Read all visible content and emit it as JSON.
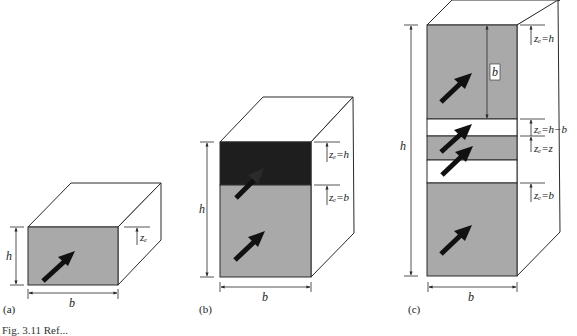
{
  "colors": {
    "face_gray": "#a9a9a9",
    "face_dark": "#1e1e1e",
    "face_white": "#ffffff",
    "line": "#2a2a2a",
    "arrow": "#111111"
  },
  "panels": [
    {
      "id": "a",
      "label": "(a)",
      "width_label": "b",
      "height_label": "h",
      "ze_labels": [
        "zₑ"
      ]
    },
    {
      "id": "b",
      "label": "(b)",
      "width_label": "b",
      "height_label": "h",
      "ze_labels": [
        "zₑ=h",
        "zₑ=b"
      ]
    },
    {
      "id": "c",
      "label": "(c)",
      "width_label": "b",
      "height_label": "h",
      "inner_label": "b",
      "ze_labels": [
        "zₑ=h",
        "zₑ=h−b",
        "zₑ=z",
        "zₑ=b"
      ]
    }
  ],
  "caption": "Fig. 3.11   Ref..."
}
